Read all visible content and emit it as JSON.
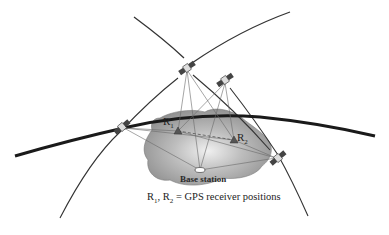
{
  "diagram": {
    "type": "GPS differential positioning illustration",
    "labels": {
      "receiver_1": {
        "base": "R",
        "sub": "1"
      },
      "receiver_2": {
        "base": "R",
        "sub": "2"
      },
      "base_station": "Base station"
    },
    "caption": {
      "r1_base": "R",
      "r1_sub": "1",
      "sep": ", ",
      "r2_base": "R",
      "r2_sub": "2",
      "rest": " = GPS receiver positions"
    },
    "satellites": [
      {
        "id": "sat-top",
        "x": 187,
        "y": 68
      },
      {
        "id": "sat-upper-right",
        "x": 225,
        "y": 80
      },
      {
        "id": "sat-left",
        "x": 122,
        "y": 127
      },
      {
        "id": "sat-right",
        "x": 278,
        "y": 158
      }
    ],
    "receivers": [
      {
        "id": "R1",
        "x": 178,
        "y": 131
      },
      {
        "id": "R2",
        "x": 234,
        "y": 140
      }
    ],
    "base_station_pos": {
      "x": 200,
      "y": 170
    },
    "colors": {
      "land_fill": "#9a9a9a",
      "land_light": "#d8d8d8",
      "orbit_thick": "#1a1a1a",
      "orbit_thin": "#333333",
      "signal_line": "#666666"
    }
  }
}
